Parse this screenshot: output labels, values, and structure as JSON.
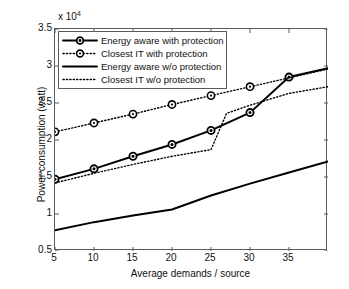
{
  "chart_data": {
    "type": "line",
    "title": "",
    "xlabel": "Average demands / source",
    "ylabel": "Power consumption (watt)",
    "y_exponent_label": "x 10",
    "y_exponent_value": "4",
    "y_scale_factor": 10000,
    "xlim": [
      5,
      40
    ],
    "ylim": [
      0.5,
      3.5
    ],
    "xticks": [
      5,
      10,
      15,
      20,
      25,
      30,
      35
    ],
    "yticks": [
      "0.5",
      "1",
      "1.5",
      "2",
      "2.5",
      "3",
      "3.5"
    ],
    "ytick_values": [
      0.5,
      1,
      1.5,
      2,
      2.5,
      3,
      3.5
    ],
    "grid": false,
    "legend_position": "upper left",
    "series": [
      {
        "name": "Energy aware with protection",
        "style": "solid",
        "marker": "circle-filled-center",
        "linewidth": 2,
        "color": "#000000",
        "x": [
          5,
          10,
          15,
          20,
          25,
          30,
          35,
          40
        ],
        "y": [
          1.47,
          1.61,
          1.78,
          1.94,
          2.13,
          2.37,
          2.85,
          2.97
        ],
        "marker_x": [
          5,
          10,
          15,
          20,
          25,
          30,
          35
        ],
        "marker_y": [
          1.47,
          1.61,
          1.78,
          1.94,
          2.13,
          2.37,
          2.85
        ]
      },
      {
        "name": "Closest IT with protection",
        "style": "dotted",
        "marker": "circle-open",
        "linewidth": 1.4,
        "color": "#000000",
        "x": [
          5,
          10,
          15,
          20,
          25,
          30,
          40
        ],
        "y": [
          2.11,
          2.23,
          2.35,
          2.48,
          2.6,
          2.72,
          2.96
        ],
        "marker_x": [
          5,
          10,
          15,
          20,
          25,
          30
        ],
        "marker_y": [
          2.11,
          2.23,
          2.35,
          2.48,
          2.6,
          2.72
        ]
      },
      {
        "name": "Energy aware w/o protection",
        "style": "solid",
        "marker": "none",
        "linewidth": 2,
        "color": "#000000",
        "x": [
          5,
          10,
          15,
          20,
          25,
          30,
          35,
          40
        ],
        "y": [
          0.78,
          0.89,
          0.98,
          1.06,
          1.25,
          1.41,
          1.56,
          1.71
        ]
      },
      {
        "name": "Closest IT w/o protection",
        "style": "dotted",
        "marker": "none",
        "linewidth": 1.4,
        "color": "#000000",
        "x": [
          5,
          10,
          15,
          20,
          25,
          27,
          30,
          35,
          40
        ],
        "y": [
          1.42,
          1.55,
          1.67,
          1.78,
          1.87,
          2.36,
          2.47,
          2.63,
          2.72
        ]
      }
    ]
  },
  "legend": {
    "items": [
      {
        "label": "Energy aware with protection"
      },
      {
        "label": "Closest IT with protection"
      },
      {
        "label": "Energy aware w/o protection"
      },
      {
        "label": "Closest IT w/o protection"
      }
    ]
  }
}
